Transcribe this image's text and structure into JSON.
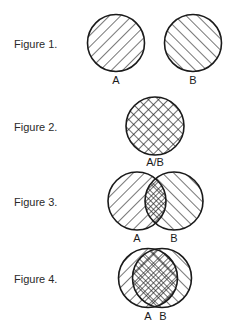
{
  "figures": [
    {
      "label": "Figure 1.",
      "label_y": 38,
      "circles": [
        {
          "name": "A",
          "cx": 116,
          "cy": 43,
          "r": 28.5,
          "hatch": "forward"
        },
        {
          "name": "B",
          "cx": 193,
          "cy": 43,
          "r": 28.5,
          "hatch": "backward"
        }
      ],
      "captions": [
        {
          "text": "A",
          "x": 116,
          "y": 84
        },
        {
          "text": "B",
          "x": 193,
          "y": 84
        }
      ]
    },
    {
      "label": "Figure 2.",
      "label_y": 121,
      "circles": [
        {
          "name": "A/B",
          "cx": 155,
          "cy": 126,
          "r": 29,
          "hatch": "cross"
        }
      ],
      "captions": [
        {
          "text": "A/B",
          "x": 155,
          "y": 166
        }
      ]
    },
    {
      "label": "Figure 3.",
      "label_y": 196,
      "circles": [
        {
          "name": "A",
          "cx": 137,
          "cy": 201,
          "r": 29,
          "hatch": "forward"
        },
        {
          "name": "B",
          "cx": 174,
          "cy": 201,
          "r": 29,
          "hatch": "backward"
        }
      ],
      "captions": [
        {
          "text": "A",
          "x": 137,
          "y": 242
        },
        {
          "text": "B",
          "x": 174,
          "y": 242
        }
      ]
    },
    {
      "label": "Figure 4.",
      "label_y": 273,
      "circles": [
        {
          "name": "A",
          "cx": 148,
          "cy": 278,
          "r": 29.5,
          "hatch": "forward"
        },
        {
          "name": "B",
          "cx": 162,
          "cy": 278,
          "r": 29.5,
          "hatch": "backward"
        }
      ],
      "captions": [
        {
          "text": "A",
          "x": 148,
          "y": 320
        },
        {
          "text": "B",
          "x": 163,
          "y": 320
        }
      ]
    }
  ],
  "colors": {
    "stroke": "#1a1a1a",
    "background": "#ffffff"
  }
}
